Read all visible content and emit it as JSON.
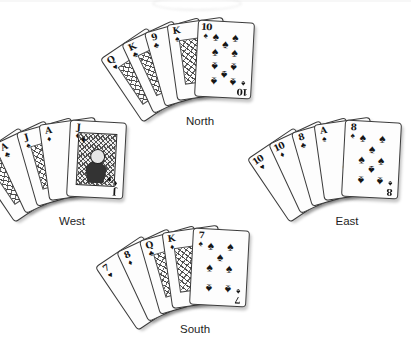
{
  "hands": [
    {
      "position": "North",
      "label": "North",
      "cards": [
        {
          "rank": "Q",
          "suit": "hearts",
          "suit_glyph": "♥"
        },
        {
          "rank": "K",
          "suit": "clubs",
          "suit_glyph": "♣"
        },
        {
          "rank": "9",
          "suit": "clubs",
          "suit_glyph": "♣"
        },
        {
          "rank": "K",
          "suit": "spades",
          "suit_glyph": "♠"
        },
        {
          "rank": "10",
          "suit": "spades",
          "suit_glyph": "♠"
        }
      ]
    },
    {
      "position": "West",
      "label": "West",
      "cards": [
        {
          "rank": "K",
          "suit": "hearts",
          "suit_glyph": "♥"
        },
        {
          "rank": "A",
          "suit": "clubs",
          "suit_glyph": "♣"
        },
        {
          "rank": "J",
          "suit": "spades",
          "suit_glyph": "♠"
        },
        {
          "rank": "A",
          "suit": "diamonds",
          "suit_glyph": "♦"
        },
        {
          "rank": "J",
          "suit": "diamonds",
          "suit_glyph": "♦"
        }
      ]
    },
    {
      "position": "East",
      "label": "East",
      "cards": [
        {
          "rank": "10",
          "suit": "hearts",
          "suit_glyph": "♥"
        },
        {
          "rank": "10",
          "suit": "diamonds",
          "suit_glyph": "♦"
        },
        {
          "rank": "8",
          "suit": "clubs",
          "suit_glyph": "♣"
        },
        {
          "rank": "A",
          "suit": "spades",
          "suit_glyph": "♠"
        },
        {
          "rank": "8",
          "suit": "spades",
          "suit_glyph": "♠"
        }
      ]
    },
    {
      "position": "South",
      "label": "South",
      "cards": [
        {
          "rank": "7",
          "suit": "hearts",
          "suit_glyph": "♥"
        },
        {
          "rank": "8",
          "suit": "diamonds",
          "suit_glyph": "♦"
        },
        {
          "rank": "Q",
          "suit": "clubs",
          "suit_glyph": "♣"
        },
        {
          "rank": "K",
          "suit": "diamonds",
          "suit_glyph": "♦"
        },
        {
          "rank": "7",
          "suit": "spades",
          "suit_glyph": "♠"
        }
      ]
    }
  ],
  "ink_color": "#161616"
}
